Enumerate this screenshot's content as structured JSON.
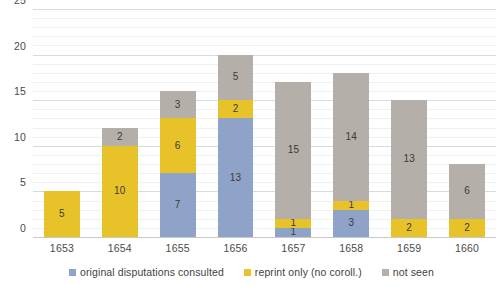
{
  "chart_data": {
    "type": "bar",
    "title": "",
    "subtitle": "",
    "xlabel": "",
    "ylabel": "",
    "stacked": true,
    "grid": true,
    "legend_position": "bottom",
    "ylim": [
      0,
      25
    ],
    "yticks": [
      0,
      5,
      10,
      15,
      20,
      25
    ],
    "minor_tick_step": 1,
    "categories": [
      "1653",
      "1654",
      "1655",
      "1656",
      "1657",
      "1658",
      "1659",
      "1660"
    ],
    "series": [
      {
        "name": "original disputations consulted",
        "color": "#8FA3C8",
        "values": [
          0,
          0,
          7,
          13,
          1,
          3,
          0,
          0
        ]
      },
      {
        "name": "reprint only (no coroll.)",
        "color": "#E8C229",
        "values": [
          5,
          10,
          6,
          2,
          1,
          1,
          2,
          2
        ]
      },
      {
        "name": "not seen",
        "color": "#B5AFA9",
        "values": [
          0,
          2,
          3,
          5,
          15,
          14,
          13,
          6
        ]
      }
    ],
    "totals": [
      5,
      12,
      16,
      20,
      17,
      18,
      15,
      8
    ]
  },
  "axis": {
    "y_tick_labels": [
      "0",
      "5",
      "10",
      "15",
      "20",
      "25"
    ],
    "x_tick_labels": [
      "1653",
      "1654",
      "1655",
      "1656",
      "1657",
      "1658",
      "1659",
      "1660"
    ]
  },
  "legend": {
    "items": [
      {
        "label": "original disputations consulted",
        "color": "#8FA3C8"
      },
      {
        "label": "reprint only (no coroll.)",
        "color": "#E8C229"
      },
      {
        "label": "not seen",
        "color": "#B5AFA9"
      }
    ]
  },
  "colors": {
    "series_blue": "#8FA3C8",
    "series_yellow": "#E8C229",
    "series_gray": "#B5AFA9",
    "gridline_minor": "#eef1f4",
    "gridline_major": "#d3dce6",
    "text": "#3f3f3f",
    "background": "#ffffff"
  }
}
